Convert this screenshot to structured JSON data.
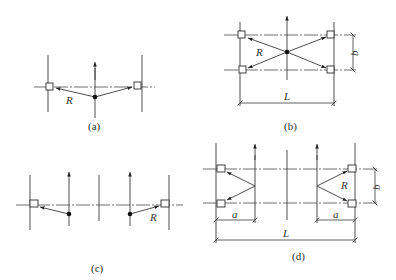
{
  "figure": {
    "panels": [
      {
        "id": "a",
        "caption": "(a)",
        "labels": {
          "radius": "R"
        }
      },
      {
        "id": "b",
        "caption": "(b)",
        "labels": {
          "radius": "R",
          "span": "L",
          "width": "b"
        }
      },
      {
        "id": "c",
        "caption": "(c)",
        "labels": {
          "radius": "R"
        }
      },
      {
        "id": "d",
        "caption": "(d)",
        "labels": {
          "radius": "R",
          "span": "L",
          "width": "b",
          "offset_left": "a",
          "offset_right": "a"
        }
      }
    ]
  },
  "colors": {
    "line": "#3a3a3a",
    "dot": "#111111",
    "background": "#ffffff"
  }
}
